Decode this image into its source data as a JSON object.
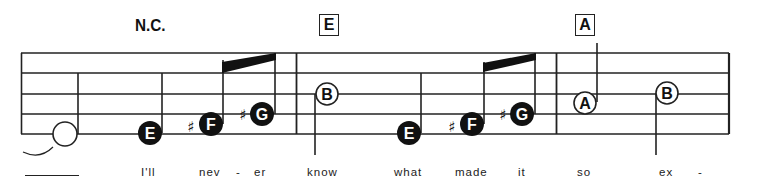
{
  "chords": {
    "nc": "N.C.",
    "box1": "E",
    "box2": "A"
  },
  "notes": [
    {
      "name": "tied-half-note",
      "label": "",
      "type": "open-half"
    },
    {
      "name": "note-e",
      "label": "E",
      "accidental": ""
    },
    {
      "name": "note-f-sharp",
      "label": "F",
      "accidental": "♯"
    },
    {
      "name": "note-g-sharp",
      "label": "G",
      "accidental": "♯"
    },
    {
      "name": "note-b",
      "label": "B",
      "type": "open"
    },
    {
      "name": "note-e",
      "label": "E",
      "accidental": ""
    },
    {
      "name": "note-f-sharp",
      "label": "F",
      "accidental": "♯"
    },
    {
      "name": "note-g-sharp",
      "label": "G",
      "accidental": "♯"
    },
    {
      "name": "note-a",
      "label": "A",
      "type": "open"
    },
    {
      "name": "note-b",
      "label": "B",
      "type": "open"
    }
  ],
  "accidentals": {
    "sharp": "♯"
  },
  "lyrics": [
    "I'll",
    "nev",
    "-",
    "er",
    "know",
    "what",
    "made",
    "it",
    "so",
    "ex",
    "-"
  ]
}
